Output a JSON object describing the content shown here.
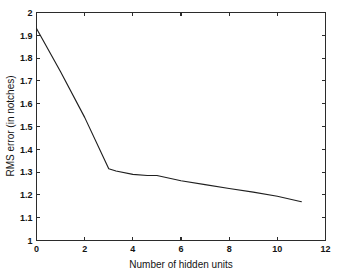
{
  "figure": {
    "background_color": "#ffffff",
    "line_color": "#1f1f1f",
    "axis_color": "#2b2b2b"
  },
  "chart_data": {
    "type": "line",
    "title": "",
    "xlabel": "Number of hidden units",
    "ylabel": "RMS error (in notches)",
    "xlim": [
      0,
      12
    ],
    "ylim": [
      1,
      2
    ],
    "grid": false,
    "legend": null,
    "xticks": [
      0,
      2,
      4,
      6,
      8,
      10,
      12
    ],
    "xticklabels": [
      "0",
      "2",
      "4",
      "6",
      "8",
      "10",
      "12"
    ],
    "yticks": [
      1,
      1.1,
      1.2,
      1.3,
      1.4,
      1.5,
      1.6,
      1.7,
      1.8,
      1.9,
      2
    ],
    "yticklabels": [
      "1",
      "1.1",
      "1.2",
      "1.3",
      "1.4",
      "1.5",
      "1.6",
      "1.7",
      "1.8",
      "1.9",
      "2"
    ],
    "series": [
      {
        "name": "RMS error",
        "x": [
          0,
          1,
          2,
          3,
          3.3,
          4,
          4.6,
          5,
          6,
          7,
          8,
          9,
          10,
          11
        ],
        "y": [
          1.93,
          1.74,
          1.54,
          1.315,
          1.305,
          1.29,
          1.285,
          1.285,
          1.262,
          1.245,
          1.228,
          1.212,
          1.194,
          1.17
        ]
      }
    ]
  }
}
